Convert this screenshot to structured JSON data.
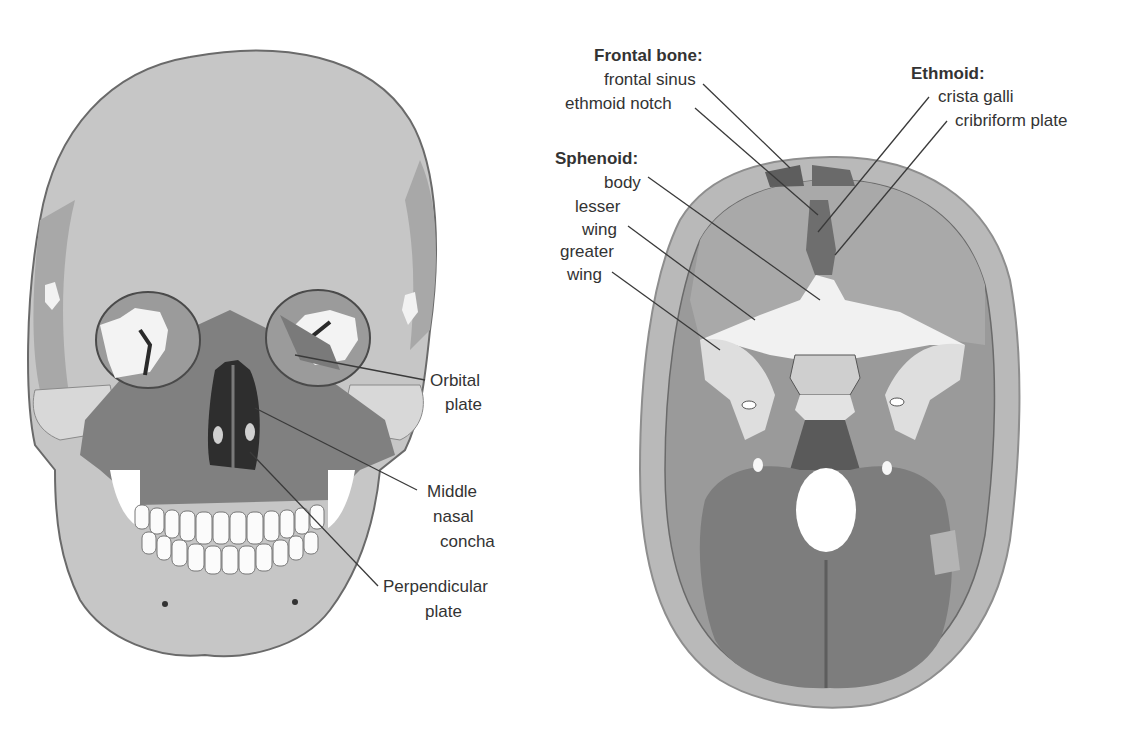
{
  "caption": {
    "text": "Figure caption (cut off at top edge)"
  },
  "figure_left": {
    "title": "Skull, anterior view",
    "labels": [
      {
        "id": "orbital-plate",
        "lines": [
          "Orbital",
          "plate"
        ]
      },
      {
        "id": "middle-nasal-concha",
        "lines": [
          "Middle",
          "nasal",
          "concha"
        ]
      },
      {
        "id": "perpendicular-plate",
        "lines": [
          "Perpendicular",
          "plate"
        ]
      }
    ]
  },
  "figure_right": {
    "title": "Cranial floor, superior view",
    "groups": [
      {
        "id": "frontal-bone",
        "header": "Frontal bone:",
        "items": [
          "frontal sinus",
          "ethmoid notch"
        ]
      },
      {
        "id": "ethmoid",
        "header": "Ethmoid:",
        "items": [
          "crista galli",
          "cribriform plate"
        ]
      },
      {
        "id": "sphenoid",
        "header": "Sphenoid:",
        "items": [
          "body",
          "lesser",
          "wing",
          "greater",
          "wing"
        ]
      }
    ]
  },
  "colors": {
    "background": "#ffffff",
    "bone_light": "#c9c9c9",
    "bone_mid": "#a9a9a9",
    "bone_dark": "#7d7d7d",
    "highlight_white": "#f4f4f4",
    "label_text": "#333333",
    "leader_line": "#3a3a3a"
  }
}
